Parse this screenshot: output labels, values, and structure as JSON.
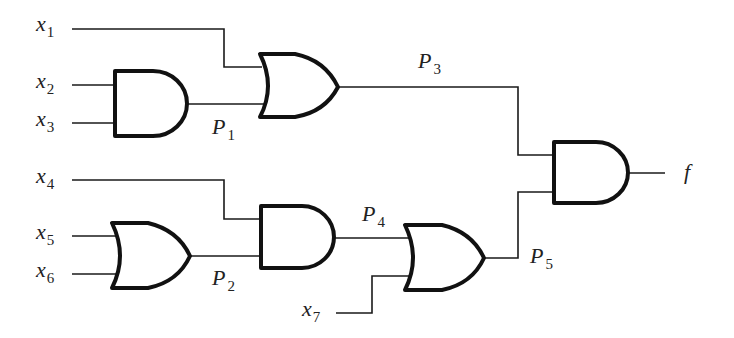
{
  "diagram": {
    "type": "logic-circuit",
    "inputs": [
      {
        "var": "x",
        "sub": "1"
      },
      {
        "var": "x",
        "sub": "2"
      },
      {
        "var": "x",
        "sub": "3"
      },
      {
        "var": "x",
        "sub": "4"
      },
      {
        "var": "x",
        "sub": "5"
      },
      {
        "var": "x",
        "sub": "6"
      },
      {
        "var": "x",
        "sub": "7"
      }
    ],
    "intermediates": [
      {
        "var": "P",
        "sub": "1",
        "gate": "AND",
        "from": [
          "x2",
          "x3"
        ]
      },
      {
        "var": "P",
        "sub": "2",
        "gate": "OR",
        "from": [
          "x5",
          "x6"
        ]
      },
      {
        "var": "P",
        "sub": "3",
        "gate": "OR",
        "from": [
          "x1",
          "P1"
        ]
      },
      {
        "var": "P",
        "sub": "4",
        "gate": "AND",
        "from": [
          "x4",
          "P2"
        ]
      },
      {
        "var": "P",
        "sub": "5",
        "gate": "OR",
        "from": [
          "P4",
          "x7"
        ]
      }
    ],
    "output": {
      "var": "f",
      "gate": "AND",
      "from": [
        "P3",
        "P5"
      ]
    },
    "colors": {
      "line": "#111111",
      "background": "#ffffff"
    }
  }
}
